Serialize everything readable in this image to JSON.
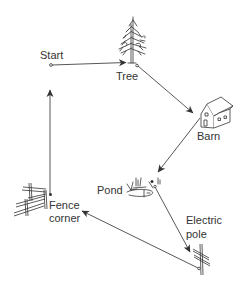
{
  "diagram": {
    "type": "route-map",
    "colors": {
      "ink": "#333333",
      "background": "#ffffff"
    },
    "nodes": [
      {
        "id": "start",
        "label": "Start",
        "icon": "start-point-icon"
      },
      {
        "id": "tree",
        "label": "Tree",
        "icon": "tree-icon"
      },
      {
        "id": "barn",
        "label": "Barn",
        "icon": "barn-icon"
      },
      {
        "id": "pond",
        "label": "Pond",
        "icon": "pond-icon"
      },
      {
        "id": "pole",
        "label_line1": "Electric",
        "label_line2": "pole",
        "icon": "electric-pole-icon"
      },
      {
        "id": "fence",
        "label_line1": "Fence",
        "label_line2": "corner",
        "icon": "fence-corner-icon"
      }
    ],
    "edges": [
      {
        "from": "Start",
        "to": "Tree"
      },
      {
        "from": "Tree",
        "to": "Barn"
      },
      {
        "from": "Barn",
        "to": "Pond"
      },
      {
        "from": "Pond",
        "to": "Electric pole"
      },
      {
        "from": "Electric pole",
        "to": "Fence corner"
      },
      {
        "from": "Fence corner",
        "to": "Start"
      }
    ]
  }
}
